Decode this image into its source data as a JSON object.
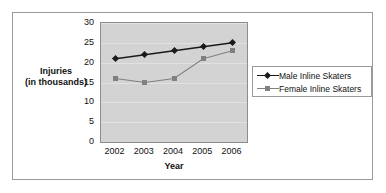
{
  "chart_data": {
    "type": "line",
    "title": "",
    "xlabel": "Year",
    "ylabel": "Injuries\n(in thousands)",
    "ylabel_line1": "Injuries",
    "ylabel_line2": "(in thousands)",
    "categories": [
      "2002",
      "2003",
      "2004",
      "2005",
      "2006"
    ],
    "ylim": [
      0,
      30
    ],
    "yticks": [
      "0",
      "5",
      "10",
      "15",
      "20",
      "25",
      "30"
    ],
    "ytick_values": [
      0,
      5,
      10,
      15,
      20,
      25,
      30
    ],
    "grid": true,
    "legend_position": "right",
    "series": [
      {
        "name": "Male Inline Skaters",
        "values": [
          21,
          22,
          23,
          24,
          25
        ],
        "color": "#1a1a1a",
        "marker": "diamond"
      },
      {
        "name": "Female Inline Skaters",
        "values": [
          16,
          15,
          16,
          21,
          23
        ],
        "color": "#808080",
        "marker": "square"
      }
    ],
    "plot_background": "#d3d3d3",
    "gridline_color": "#e2e2e2",
    "axis_color": "#8c8c8c"
  }
}
